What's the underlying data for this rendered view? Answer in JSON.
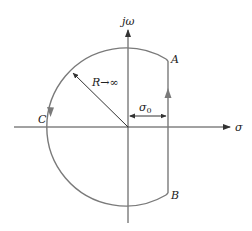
{
  "diagram": {
    "axes": {
      "horizontal_label": "σ",
      "vertical_label": "jω"
    },
    "points": {
      "A": "A",
      "B": "B",
      "C": "C"
    },
    "radius_label": "R→∞",
    "offset_label": "σ",
    "offset_subscript": "0",
    "colors": {
      "contour": "#7a7a7a",
      "axes": "#333333",
      "text": "#222222"
    }
  }
}
